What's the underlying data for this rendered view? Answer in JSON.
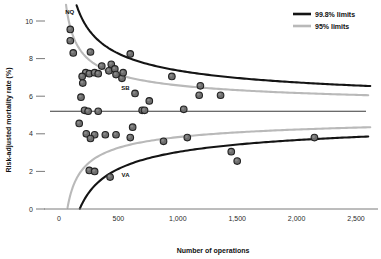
{
  "chart_data": {
    "type": "scatter",
    "title": "",
    "xlabel": "Number of operations",
    "ylabel": "Risk-adjusted mortality rate (%)",
    "xlim": [
      -80,
      2700
    ],
    "ylim": [
      0,
      10.9
    ],
    "xticks": [
      0,
      500,
      1000,
      1500,
      2000,
      2500
    ],
    "xtick_labels": [
      "0",
      "500",
      "1,000",
      "1,500",
      "2,000",
      "2,500"
    ],
    "yticks": [
      0,
      2,
      4,
      6,
      8,
      10
    ],
    "ytick_labels": [
      "0",
      "2",
      "4",
      "6",
      "8",
      "10"
    ],
    "grid": false,
    "target_value": 5.2,
    "legend": {
      "position": "top-right",
      "entries": [
        {
          "label": "99.8% limits",
          "color": "#141414"
        },
        {
          "label": "95% limits",
          "color": "#b9b9b9"
        }
      ]
    },
    "annotations": [
      {
        "text": "NQ",
        "x": 90,
        "y": 10.35
      },
      {
        "text": "SB",
        "x": 560,
        "y": 6.35
      },
      {
        "text": "VA",
        "x": 560,
        "y": 1.72
      }
    ],
    "series": [
      {
        "name": "Hospitals",
        "marker": "circle",
        "points": [
          [
            95,
            9.55
          ],
          [
            95,
            8.95
          ],
          [
            120,
            8.3
          ],
          [
            265,
            8.35
          ],
          [
            600,
            8.25
          ],
          [
            360,
            7.6
          ],
          [
            420,
            7.35
          ],
          [
            440,
            7.7
          ],
          [
            470,
            7.45
          ],
          [
            480,
            7.15
          ],
          [
            225,
            7.25
          ],
          [
            255,
            7.2
          ],
          [
            300,
            7.25
          ],
          [
            330,
            7.2
          ],
          [
            195,
            7.05
          ],
          [
            200,
            6.7
          ],
          [
            530,
            6.95
          ],
          [
            540,
            7.25
          ],
          [
            950,
            7.05
          ],
          [
            1190,
            6.55
          ],
          [
            640,
            6.15
          ],
          [
            1180,
            6.05
          ],
          [
            1360,
            6.05
          ],
          [
            185,
            5.95
          ],
          [
            760,
            5.75
          ],
          [
            215,
            5.25
          ],
          [
            245,
            5.2
          ],
          [
            330,
            5.2
          ],
          [
            700,
            5.25
          ],
          [
            720,
            5.25
          ],
          [
            1050,
            5.3
          ],
          [
            170,
            4.55
          ],
          [
            230,
            4.0
          ],
          [
            300,
            3.95
          ],
          [
            390,
            3.95
          ],
          [
            480,
            3.95
          ],
          [
            265,
            3.75
          ],
          [
            600,
            3.8
          ],
          [
            1080,
            3.8
          ],
          [
            620,
            4.35
          ],
          [
            880,
            3.6
          ],
          [
            255,
            2.05
          ],
          [
            300,
            2.0
          ],
          [
            1500,
            2.55
          ],
          [
            430,
            1.7
          ],
          [
            2150,
            3.8
          ],
          [
            1450,
            3.05
          ]
        ]
      }
    ],
    "limit_curves": {
      "upper_998": {
        "label": "99.8% upper limit",
        "color": "#141414"
      },
      "lower_998": {
        "label": "99.8% lower limit",
        "color": "#141414"
      },
      "upper_95": {
        "label": "95% upper limit",
        "color": "#b9b9b9"
      },
      "lower_95": {
        "label": "95% lower limit",
        "color": "#b9b9b9"
      }
    }
  }
}
